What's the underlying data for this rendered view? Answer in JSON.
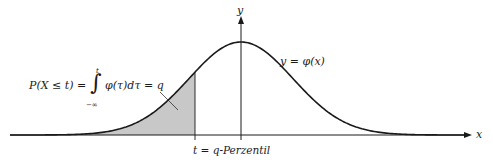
{
  "diagram": {
    "axes": {
      "x_label": "x",
      "y_label": "y"
    },
    "curve_label": "y = φ(x)",
    "formula": {
      "lhs": "P(X ≤ t) =",
      "integral_upper": "t",
      "integral_lower": "−∞",
      "integrand": "φ(τ)dτ = q"
    },
    "quantile_label": "t = q-Perzentil",
    "colors": {
      "curve": "#1a1a1a",
      "axes": "#1a1a1a",
      "shade": "#c8c8c8",
      "background": "#ffffff"
    }
  }
}
